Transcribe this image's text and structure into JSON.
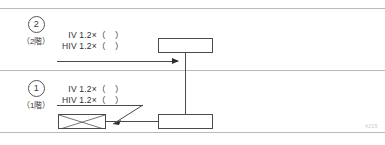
{
  "figure": {
    "type": "riser-diagram",
    "corner_mark": "4205",
    "floors": [
      {
        "id": "floor-2",
        "number_symbol": "②",
        "number_text": "2",
        "floor_label": "（2階）",
        "wire_labels": [
          "IV 1.2×（　）",
          "HIV 1.2×（　）"
        ]
      },
      {
        "id": "floor-1",
        "number_symbol": "①",
        "number_text": "1",
        "floor_label": "（1階）",
        "wire_labels": [
          "IV 1.2×（　）",
          "HIV 1.2×（　）"
        ]
      }
    ],
    "symbols": {
      "box_upper": "distribution-box-2f",
      "box_lower": "distribution-box-1f",
      "crossed_box": "crossed-terminal-box"
    },
    "colors": {
      "line": "#4a4a4a",
      "rule": "#b9b9b9",
      "text": "#2e2e2e",
      "background": "#ffffff"
    }
  }
}
